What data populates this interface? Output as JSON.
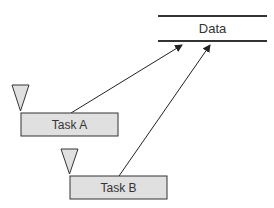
{
  "diagram": {
    "data_store": {
      "label": "Data"
    },
    "tasks": [
      {
        "label": "Task A"
      },
      {
        "label": "Task B"
      }
    ],
    "connections": [
      {
        "from": "Task A",
        "to": "Data"
      },
      {
        "from": "Task B",
        "to": "Data"
      }
    ],
    "colors": {
      "box_fill": "#e0e0e0",
      "stroke": "#333333",
      "line": "#222222"
    }
  }
}
